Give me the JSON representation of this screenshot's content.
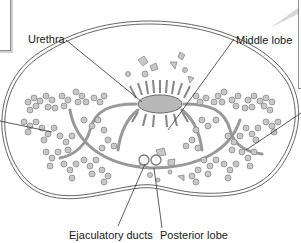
{
  "diagram": {
    "labels": {
      "urethra": "Urethra",
      "middle_lobe": "Middle lobe",
      "ejaculatory_ducts": "Ejaculatory ducts",
      "posterior_lobe": "Posterior lobe"
    },
    "colors": {
      "outline": "#555555",
      "gland_fill": "#c8c8c8",
      "gland_stroke": "#808080",
      "leader_line": "#333333",
      "background": "#ffffff"
    }
  }
}
